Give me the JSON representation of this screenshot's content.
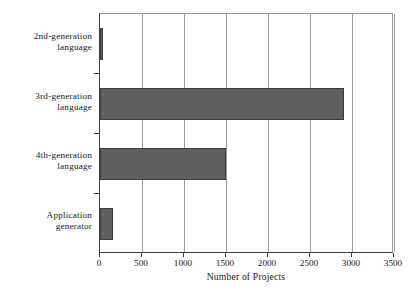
{
  "chart_data": {
    "type": "bar",
    "orientation": "horizontal",
    "title": "",
    "xlabel": "Number of Projects",
    "ylabel": "",
    "categories": [
      "2nd-generation language",
      "3rd-generation language",
      "4th-generation language",
      "Application generator"
    ],
    "category_lines": [
      [
        "2nd-generation",
        "language"
      ],
      [
        "3rd-generation",
        "language"
      ],
      [
        "4th-generation",
        "language"
      ],
      [
        "Application",
        "generator"
      ]
    ],
    "values": [
      30,
      2900,
      1500,
      150
    ],
    "xlim": [
      0,
      3500
    ],
    "xticks": [
      0,
      500,
      1000,
      1500,
      2000,
      2500,
      3000,
      3500
    ],
    "xtick_labels": [
      "0",
      "500",
      "1000",
      "1500",
      "2000",
      "2500",
      "3000",
      "3500"
    ],
    "grid": "vertical",
    "legend": "none",
    "colors": {
      "bar_fill": "#5f5f5f",
      "bar_edge": "#3c3c3c",
      "gridline": "#9d9d9d",
      "axis": "#3c3c3c",
      "plot_border": "#9a9a9a",
      "background": "#ffffff",
      "text": "#1a1a1a"
    }
  }
}
